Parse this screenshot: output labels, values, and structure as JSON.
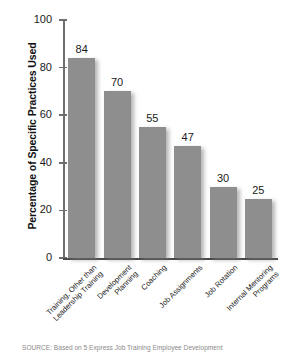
{
  "chart_data": {
    "type": "bar",
    "title": "",
    "xlabel": "",
    "ylabel": "Percentage of Specific Practices Used",
    "ylim": [
      0,
      100
    ],
    "yticks": [
      0,
      20,
      40,
      60,
      80,
      100
    ],
    "grid": false,
    "legend": false,
    "orientation": "vertical",
    "bar_color": "#8e8e8e",
    "categories": [
      "Training, Other than\nLeadership Training",
      "Development\nPlanning",
      "Coaching",
      "Job Assignments",
      "Job Rotation",
      "Internal Mentoring\nPrograms"
    ],
    "values": [
      84,
      70,
      55,
      47,
      30,
      25
    ],
    "value_labels": [
      "84",
      "70",
      "55",
      "47",
      "30",
      "25"
    ]
  },
  "axis": {
    "y_title": "Percentage of Specific Practices Used",
    "y_tick_labels": [
      "100",
      "80",
      "60",
      "40",
      "20",
      "0"
    ]
  },
  "source": {
    "text": "SOURCE: Based on 5 Express Job Training Employee Development"
  }
}
